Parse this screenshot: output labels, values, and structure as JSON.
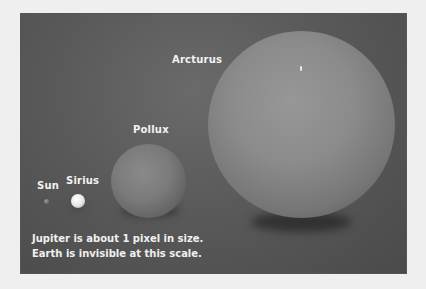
{
  "figure": {
    "stars": [
      {
        "name": "Sun",
        "label": "Sun",
        "relative_size": "tiny"
      },
      {
        "name": "Sirius",
        "label": "Sirius",
        "relative_size": "small"
      },
      {
        "name": "Pollux",
        "label": "Pollux",
        "relative_size": "medium"
      },
      {
        "name": "Arcturus",
        "label": "Arcturus",
        "relative_size": "large"
      }
    ],
    "caption": {
      "line1": "Jupiter is about 1 pixel in size.",
      "line2": "Earth is invisible at this scale."
    },
    "colors": {
      "background": "#efefef",
      "panel": "#5a5a5a",
      "label": "#f2f2f2"
    }
  }
}
